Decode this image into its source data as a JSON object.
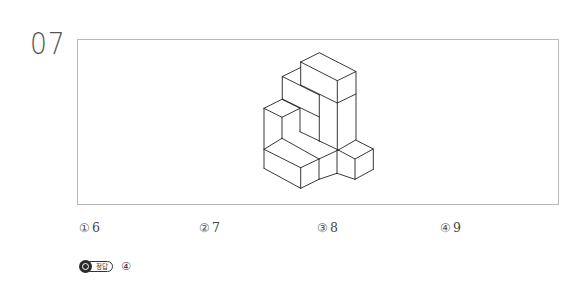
{
  "question": {
    "number": "07",
    "figure": {
      "description": "isometric block stack figure",
      "stroke_color": "#222222"
    },
    "choices": [
      {
        "mark": "①",
        "value": "6"
      },
      {
        "mark": "②",
        "value": "7"
      },
      {
        "mark": "③",
        "value": "8"
      },
      {
        "mark": "④",
        "value": "9"
      }
    ]
  },
  "answer": {
    "badge_label": "정답",
    "value": "④"
  }
}
